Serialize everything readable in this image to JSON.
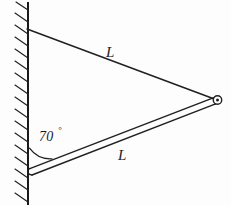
{
  "figure": {
    "background_color": "#fdfdfd",
    "ink_color": "#221f20",
    "width": 231,
    "height": 205
  },
  "labels": {
    "cable_length": "L",
    "beam_length": "L",
    "angle_value": "70",
    "angle_unit": "°"
  },
  "elements": {
    "wall_name": "hatched vertical wall",
    "cable_name": "upper cable of length L",
    "beam_name": "lower beam of length L",
    "pin_name": "pin joint at free end",
    "arc_name": "angle arc between wall and beam"
  },
  "geometry": {
    "wall_x": 28,
    "wall_top_y": 3,
    "wall_bottom_y": 205,
    "cable_anchor": [
      27,
      29
    ],
    "beam_anchor": [
      29,
      172
    ],
    "joint": [
      217,
      100
    ],
    "beam_thickness": 6,
    "angle_degrees": 70,
    "hatch_count": 17,
    "hatch_length": 13,
    "hatch_spacing": 12
  },
  "chart_data": {
    "type": "diagram",
    "segments": [
      {
        "name": "cable",
        "label": "L",
        "from": [
          27,
          29
        ],
        "to": [
          217,
          100
        ]
      },
      {
        "name": "beam",
        "label": "L",
        "from": [
          29,
          172
        ],
        "to": [
          217,
          100
        ]
      },
      {
        "name": "wall",
        "label": "",
        "from": [
          28,
          3
        ],
        "to": [
          28,
          205
        ]
      }
    ],
    "annotations": [
      {
        "name": "angle",
        "text": "70°",
        "at": [
          48,
          137
        ]
      },
      {
        "name": "cable-length",
        "text": "L",
        "at": [
          111,
          52
        ]
      },
      {
        "name": "beam-length",
        "text": "L",
        "at": [
          123,
          155
        ]
      }
    ]
  }
}
